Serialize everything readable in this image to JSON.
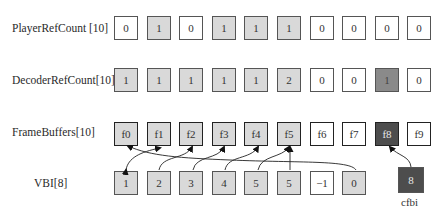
{
  "rows": {
    "player_ref_count": {
      "label": "PlayerRefCount [10]",
      "values": [
        "0",
        "1",
        "0",
        "1",
        "1",
        "1",
        "0",
        "0",
        "0",
        "0"
      ],
      "shades": [
        "white",
        "light",
        "white",
        "light",
        "light",
        "light",
        "white",
        "white",
        "white",
        "white"
      ]
    },
    "decoder_ref_count": {
      "label": "DecoderRefCount[10]",
      "values": [
        "1",
        "1",
        "1",
        "1",
        "1",
        "2",
        "0",
        "0",
        "1",
        "0"
      ],
      "shades": [
        "light",
        "light",
        "light",
        "light",
        "light",
        "light",
        "white",
        "white",
        "mid",
        "white"
      ]
    },
    "frame_buffers": {
      "label": "FrameBuffers[10]",
      "values": [
        "f0",
        "f1",
        "f2",
        "f3",
        "f4",
        "f5",
        "f6",
        "f7",
        "f8",
        "f9"
      ],
      "shades": [
        "light",
        "light",
        "light",
        "light",
        "light",
        "light",
        "white",
        "white",
        "dark",
        "white"
      ]
    },
    "vbi": {
      "label": "VBI[8]",
      "values": [
        "1",
        "2",
        "3",
        "4",
        "5",
        "5",
        "−1",
        "0"
      ],
      "shades": [
        "light",
        "light",
        "light",
        "light",
        "light",
        "light",
        "white",
        "light"
      ]
    }
  },
  "cfbi": {
    "value": "8",
    "label": "cfbi"
  },
  "colors": {
    "white": "#ffffff",
    "light": "#d9d9d9",
    "mid": "#8a8a8a",
    "dark": "#4d4d4d",
    "border": "#555555"
  },
  "arrows": [
    {
      "from": "vbi.0",
      "to": "frame_buffers.1"
    },
    {
      "from": "vbi.1",
      "to": "frame_buffers.2"
    },
    {
      "from": "vbi.2",
      "to": "frame_buffers.3"
    },
    {
      "from": "vbi.3",
      "to": "frame_buffers.4"
    },
    {
      "from": "vbi.4",
      "to": "frame_buffers.5"
    },
    {
      "from": "vbi.5",
      "to": "frame_buffers.5"
    },
    {
      "from": "vbi.7",
      "to": "frame_buffers.0"
    },
    {
      "from": "cfbi",
      "to": "frame_buffers.8"
    }
  ]
}
